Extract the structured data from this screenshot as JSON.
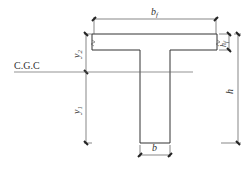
{
  "diagram": {
    "labels": {
      "flange_width": "b",
      "flange_width_sub": "f",
      "flange_thickness": "h",
      "flange_thickness_sub": "f",
      "total_height": "h",
      "web_width": "b",
      "centroid": "C.G.C",
      "y_top": "y",
      "y_top_sub": "2",
      "y_bottom": "y",
      "y_bottom_sub": "1"
    },
    "colors": {
      "outline": "#333333",
      "dimension": "#555555",
      "background": "#ffffff"
    }
  }
}
